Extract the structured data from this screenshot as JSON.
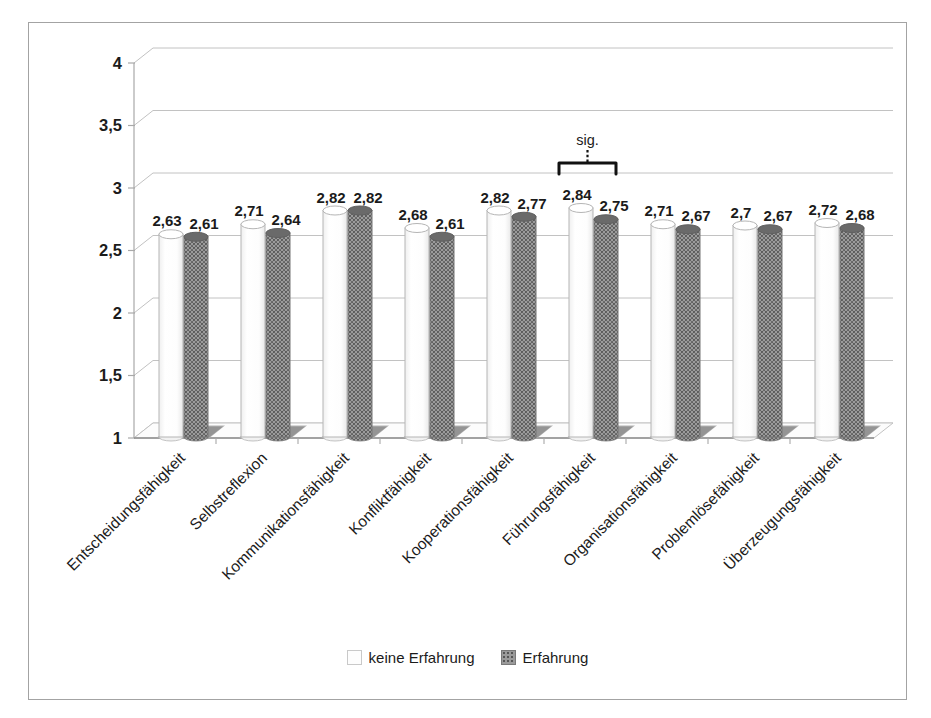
{
  "chart_data": {
    "type": "bar",
    "style": "3d-cylinder",
    "title": "",
    "xlabel": "",
    "ylabel": "",
    "categories": [
      "Entscheidungsfähigkeit",
      "Selbstreflexion",
      "Kommunikationsfähigkeit",
      "Konfliktfähigkeit",
      "Kooperationsfähigkeit",
      "Führungsfähigkeit",
      "Organisationsfähigkeit",
      "Problemlösefähigkeit",
      "Überzeugungsfähigkeit"
    ],
    "series": [
      {
        "name": "keine Erfahrung",
        "swatch": "light",
        "color": "#fbfbfb",
        "values": [
          2.63,
          2.71,
          2.82,
          2.68,
          2.82,
          2.84,
          2.71,
          2.7,
          2.72
        ],
        "labels": [
          "2,63",
          "2,71",
          "2,82",
          "2,68",
          "2,82",
          "2,84",
          "2,71",
          "2,7",
          "2,72"
        ]
      },
      {
        "name": "Erfahrung",
        "swatch": "dark",
        "color": "#8a8a8a",
        "values": [
          2.61,
          2.64,
          2.82,
          2.61,
          2.77,
          2.75,
          2.67,
          2.67,
          2.68
        ],
        "labels": [
          "2,61",
          "2,64",
          "2,82",
          "2,61",
          "2,77",
          "2,75",
          "2,67",
          "2,67",
          "2,68"
        ]
      }
    ],
    "ylim": [
      1,
      4
    ],
    "ytick_step": 0.5,
    "ytick_labels": [
      "4",
      "3,5",
      "3",
      "2,5",
      "2",
      "1,5",
      "1"
    ],
    "grid": true,
    "legend_position": "bottom",
    "annotation": {
      "text": "sig.",
      "category_index": 5
    },
    "colors": {
      "grid": "#c2c2c2",
      "axis": "#a8a8a8",
      "floor_edge": "#8c8c8c",
      "text": "#1b1b1b",
      "shadow": "#b4b4b4",
      "shadow_dark": "#949494",
      "bar_light_stroke": "#b5b5b5",
      "bar_dark_top": "#6a6a6a",
      "annotation_color": "#111111"
    }
  }
}
